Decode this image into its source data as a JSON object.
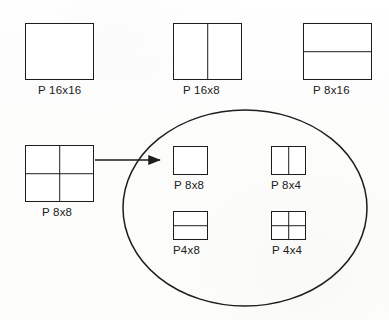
{
  "figure": {
    "kind": "diagram",
    "background_color": "#fdfdfd",
    "line_color": "#1d1d1d",
    "text_color": "#202020"
  },
  "partitions": [
    {
      "id": "p16x16",
      "label": "P 16x16",
      "split": "none",
      "box": {
        "x": 25,
        "y": 23,
        "w": 69,
        "h": 57
      },
      "label_pos": {
        "x": 38,
        "y": 84
      },
      "group": "macroblock-partitions"
    },
    {
      "id": "p16x8",
      "label": "P 16x8",
      "split": "vertical",
      "box": {
        "x": 173,
        "y": 23,
        "w": 69,
        "h": 57
      },
      "label_pos": {
        "x": 183,
        "y": 84
      },
      "group": "macroblock-partitions"
    },
    {
      "id": "p8x16",
      "label": "P 8x16",
      "split": "horizontal",
      "box": {
        "x": 303,
        "y": 23,
        "w": 69,
        "h": 57
      },
      "label_pos": {
        "x": 313,
        "y": 84
      },
      "group": "macroblock-partitions"
    },
    {
      "id": "p8x8-source",
      "label": "P 8x8",
      "split": "quad",
      "box": {
        "x": 25,
        "y": 145,
        "w": 69,
        "h": 57
      },
      "label_pos": {
        "x": 42,
        "y": 206
      },
      "group": "macroblock-partitions"
    },
    {
      "id": "p8x8-sub",
      "label": "P 8x8",
      "split": "none",
      "box": {
        "x": 173,
        "y": 146,
        "w": 35,
        "h": 29
      },
      "label_pos": {
        "x": 174,
        "y": 179
      },
      "group": "sub-macroblock-partitions"
    },
    {
      "id": "p8x4-sub",
      "label": "P 8x4",
      "split": "vertical",
      "box": {
        "x": 271,
        "y": 146,
        "w": 35,
        "h": 29
      },
      "label_pos": {
        "x": 271,
        "y": 179
      },
      "group": "sub-macroblock-partitions"
    },
    {
      "id": "p4x8-sub",
      "label": "P4x8",
      "split": "horizontal",
      "box": {
        "x": 173,
        "y": 211,
        "w": 35,
        "h": 29
      },
      "label_pos": {
        "x": 173,
        "y": 244
      },
      "group": "sub-macroblock-partitions"
    },
    {
      "id": "p4x4-sub",
      "label": "P 4x4",
      "split": "quad",
      "box": {
        "x": 271,
        "y": 211,
        "w": 35,
        "h": 29
      },
      "label_pos": {
        "x": 272,
        "y": 244
      },
      "group": "sub-macroblock-partitions"
    }
  ],
  "grouping_ellipse": {
    "name": "sub-macroblock-partition-group",
    "center_x": 245,
    "center_y": 208,
    "radius_x": 122,
    "radius_y": 98,
    "stroke": "#1d1d1d",
    "stroke_width": 1.5,
    "fill": "none"
  },
  "connector_arrow": {
    "name": "p8x8-expands-to-sub-partitions",
    "from_x": 95,
    "from_y": 160,
    "to_x": 162,
    "to_y": 160,
    "stroke": "#1d1d1d",
    "stroke_width": 1.4
  }
}
